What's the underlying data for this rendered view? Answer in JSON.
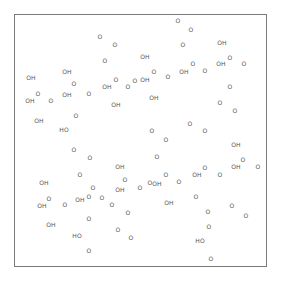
{
  "diagram": {
    "type": "chemical-structure",
    "frame": {
      "x": 14,
      "y": 14,
      "width": 253,
      "height": 253,
      "border_color": "#7a7a7a"
    },
    "label_color": "#555555",
    "atoms": [
      {
        "label": "O",
        "x": 178,
        "y": 21
      },
      {
        "label": "O",
        "x": 100,
        "y": 37
      },
      {
        "label": "O",
        "x": 191,
        "y": 30
      },
      {
        "label": "O",
        "x": 115,
        "y": 45
      },
      {
        "label": "O",
        "x": 183,
        "y": 45
      },
      {
        "label": "OH",
        "x": 222,
        "y": 43
      },
      {
        "label": "OH",
        "x": 145,
        "y": 57
      },
      {
        "label": "O",
        "x": 105,
        "y": 61
      },
      {
        "label": "O",
        "x": 230,
        "y": 58
      },
      {
        "label": "O",
        "x": 193,
        "y": 64
      },
      {
        "label": "OH",
        "x": 221,
        "y": 64
      },
      {
        "label": "O",
        "x": 244,
        "y": 64
      },
      {
        "label": "OH",
        "x": 67,
        "y": 72
      },
      {
        "label": "O",
        "x": 154,
        "y": 72
      },
      {
        "label": "OH",
        "x": 184,
        "y": 72
      },
      {
        "label": "O",
        "x": 205,
        "y": 71
      },
      {
        "label": "OH",
        "x": 31,
        "y": 78
      },
      {
        "label": "O",
        "x": 116,
        "y": 80
      },
      {
        "label": "OH",
        "x": 145,
        "y": 80
      },
      {
        "label": "O",
        "x": 168,
        "y": 77
      },
      {
        "label": "O",
        "x": 135,
        "y": 81
      },
      {
        "label": "O",
        "x": 74,
        "y": 84
      },
      {
        "label": "O",
        "x": 38,
        "y": 94
      },
      {
        "label": "OH",
        "x": 107,
        "y": 87
      },
      {
        "label": "O",
        "x": 89,
        "y": 94
      },
      {
        "label": "O",
        "x": 128,
        "y": 87
      },
      {
        "label": "O",
        "x": 230,
        "y": 87
      },
      {
        "label": "OH",
        "x": 67,
        "y": 95
      },
      {
        "label": "OH",
        "x": 30,
        "y": 101
      },
      {
        "label": "O",
        "x": 51,
        "y": 101
      },
      {
        "label": "OH",
        "x": 154,
        "y": 98
      },
      {
        "label": "O",
        "x": 220,
        "y": 103
      },
      {
        "label": "OH",
        "x": 116,
        "y": 105
      },
      {
        "label": "O",
        "x": 235,
        "y": 111
      },
      {
        "label": "O",
        "x": 76,
        "y": 116
      },
      {
        "label": "OH",
        "x": 39,
        "y": 121
      },
      {
        "label": "O",
        "x": 190,
        "y": 124
      },
      {
        "label": "HO",
        "x": 64,
        "y": 130
      },
      {
        "label": "O",
        "x": 152,
        "y": 131
      },
      {
        "label": "O",
        "x": 205,
        "y": 131
      },
      {
        "label": "O",
        "x": 166,
        "y": 140
      },
      {
        "label": "O",
        "x": 74,
        "y": 150
      },
      {
        "label": "OH",
        "x": 236,
        "y": 145
      },
      {
        "label": "O",
        "x": 90,
        "y": 158
      },
      {
        "label": "O",
        "x": 157,
        "y": 157
      },
      {
        "label": "O",
        "x": 243,
        "y": 160
      },
      {
        "label": "OH",
        "x": 120,
        "y": 167
      },
      {
        "label": "OH",
        "x": 236,
        "y": 167
      },
      {
        "label": "O",
        "x": 258,
        "y": 167
      },
      {
        "label": "O",
        "x": 205,
        "y": 168
      },
      {
        "label": "O",
        "x": 80,
        "y": 175
      },
      {
        "label": "O",
        "x": 166,
        "y": 175
      },
      {
        "label": "OH",
        "x": 197,
        "y": 175
      },
      {
        "label": "O",
        "x": 220,
        "y": 175
      },
      {
        "label": "OH",
        "x": 44,
        "y": 183
      },
      {
        "label": "O",
        "x": 125,
        "y": 180
      },
      {
        "label": "O",
        "x": 150,
        "y": 183
      },
      {
        "label": "OH",
        "x": 157,
        "y": 184
      },
      {
        "label": "O",
        "x": 179,
        "y": 182
      },
      {
        "label": "O",
        "x": 93,
        "y": 188
      },
      {
        "label": "OH",
        "x": 120,
        "y": 190
      },
      {
        "label": "O",
        "x": 140,
        "y": 188
      },
      {
        "label": "O",
        "x": 49,
        "y": 199
      },
      {
        "label": "O",
        "x": 89,
        "y": 197
      },
      {
        "label": "OH",
        "x": 80,
        "y": 200
      },
      {
        "label": "O",
        "x": 102,
        "y": 198
      },
      {
        "label": "OH",
        "x": 42,
        "y": 206
      },
      {
        "label": "O",
        "x": 65,
        "y": 205
      },
      {
        "label": "O",
        "x": 112,
        "y": 205
      },
      {
        "label": "OH",
        "x": 169,
        "y": 203
      },
      {
        "label": "O",
        "x": 196,
        "y": 197
      },
      {
        "label": "O",
        "x": 232,
        "y": 206
      },
      {
        "label": "O",
        "x": 128,
        "y": 213
      },
      {
        "label": "O",
        "x": 208,
        "y": 212
      },
      {
        "label": "O",
        "x": 246,
        "y": 216
      },
      {
        "label": "OH",
        "x": 51,
        "y": 225
      },
      {
        "label": "O",
        "x": 89,
        "y": 219
      },
      {
        "label": "O",
        "x": 118,
        "y": 230
      },
      {
        "label": "O",
        "x": 209,
        "y": 227
      },
      {
        "label": "HO",
        "x": 77,
        "y": 236
      },
      {
        "label": "O",
        "x": 131,
        "y": 238
      },
      {
        "label": "HO",
        "x": 200,
        "y": 241
      },
      {
        "label": "O",
        "x": 89,
        "y": 251
      },
      {
        "label": "O",
        "x": 211,
        "y": 259
      }
    ]
  }
}
